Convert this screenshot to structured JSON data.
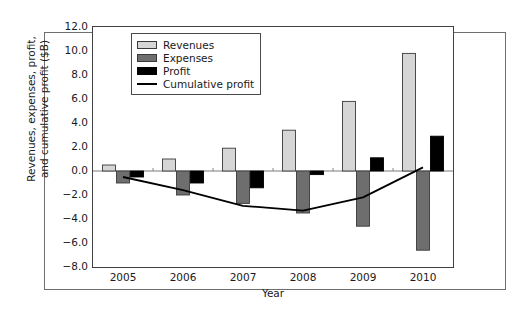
{
  "chart_data": {
    "type": "bar",
    "title": "",
    "xlabel": "Year",
    "ylabel": "Revenues, expenses, profit, and cumulative profit ($B)",
    "categories": [
      "2005",
      "2006",
      "2007",
      "2008",
      "2009",
      "2010"
    ],
    "ylim": [
      -8.0,
      12.0
    ],
    "ytick_labels": [
      "12.0",
      "10.0",
      "8.0",
      "6.0",
      "4.0",
      "2.0",
      "0.0",
      "−2.0",
      "−4.0",
      "−6.0",
      "−8.0"
    ],
    "ytick_values": [
      12.0,
      10.0,
      8.0,
      6.0,
      4.0,
      2.0,
      0.0,
      -2.0,
      -4.0,
      -6.0,
      -8.0
    ],
    "grid": false,
    "legend_position": "upper left",
    "series": [
      {
        "name": "Revenues",
        "kind": "bar",
        "color": "#d6d6d6",
        "edge": "#3a3a3a",
        "values": [
          0.5,
          1.0,
          1.9,
          3.4,
          5.8,
          9.8
        ]
      },
      {
        "name": "Expenses",
        "kind": "bar",
        "color": "#6e6e6e",
        "edge": "#3a3a3a",
        "values": [
          -1.0,
          -2.0,
          -2.7,
          -3.5,
          -4.6,
          -6.6
        ]
      },
      {
        "name": "Profit",
        "kind": "bar",
        "color": "#000000",
        "edge": "#000000",
        "values": [
          -0.5,
          -1.0,
          -1.4,
          -0.3,
          1.1,
          2.9
        ]
      },
      {
        "name": "Cumulative profit",
        "kind": "line",
        "color": "#000000",
        "values": [
          -0.5,
          -1.6,
          -2.9,
          -3.3,
          -2.2,
          0.3
        ]
      }
    ]
  },
  "legend": {
    "entries": [
      {
        "label": "Revenues",
        "swatch": "light-gray-box"
      },
      {
        "label": "Expenses",
        "swatch": "dark-gray-box"
      },
      {
        "label": "Profit",
        "swatch": "black-box"
      },
      {
        "label": "Cumulative profit",
        "swatch": "black-line"
      }
    ]
  },
  "axes": {
    "x_title": "Year",
    "y_title_line1": "Revenues, expenses, profit,",
    "y_title_line2": "and cumulative profit ($B)"
  }
}
